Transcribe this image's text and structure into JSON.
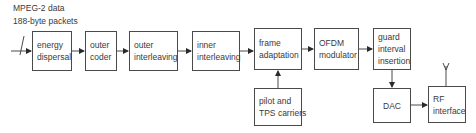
{
  "input_label": {
    "line1": "MPEG-2 data",
    "line2": "188-byte packets"
  },
  "blocks": {
    "energy_dispersal": [
      "energy",
      "dispersal"
    ],
    "outer_coder": [
      "outer",
      "coder"
    ],
    "outer_interleaving": [
      "outer",
      "interleaving"
    ],
    "inner_interleaving": [
      "inner",
      "interleaving"
    ],
    "frame_adaptation": [
      "frame",
      "adaptation"
    ],
    "ofdm_modulator": [
      "OFDM",
      "modulator"
    ],
    "guard_interval_insertion": [
      "guard",
      "interval",
      "insertion"
    ],
    "pilot_tps": [
      "pilot and",
      "TPS carriers"
    ],
    "dac": [
      "DAC"
    ],
    "rf_interface": [
      "RF",
      "interface"
    ]
  },
  "colors": {
    "line": "#4a4a4a",
    "text": "#3a3a3a"
  }
}
